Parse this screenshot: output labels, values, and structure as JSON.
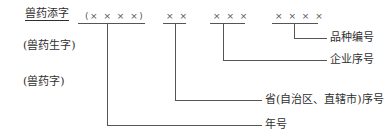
{
  "diagram": {
    "prefix_options": [
      "兽药添字",
      "(兽药生字)",
      "(兽药字)"
    ],
    "segments": [
      {
        "placeholder": "(× × × ×)",
        "label": "年号"
      },
      {
        "placeholder": "× ×",
        "label": "省(自治区、直辖市)序号"
      },
      {
        "placeholder": "× × ×",
        "label": "企业序号"
      },
      {
        "placeholder": "× × × ×",
        "label": "品种编号"
      }
    ]
  }
}
